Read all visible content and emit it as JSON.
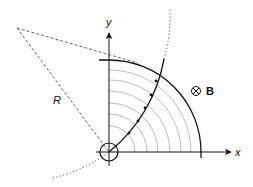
{
  "diagram": {
    "type": "physics-figure",
    "labels": {
      "x_axis": "x",
      "y_axis": "y",
      "radius": "R",
      "field_symbol": "⊗",
      "field_label": "B"
    },
    "colors": {
      "ink": "#111111",
      "reference_arcs": "#bdbdbd",
      "dashed": "#555555"
    },
    "geometry": {
      "origin": [
        109,
        152
      ],
      "outer_arc_radius": 92,
      "reference_arc_radii": [
        26,
        38,
        49,
        61,
        72,
        82
      ],
      "source_circle_radius": 9,
      "trajectory_center": [
        17,
        28
      ],
      "trajectory_radius": 154,
      "trajectory_markers": 5
    }
  }
}
